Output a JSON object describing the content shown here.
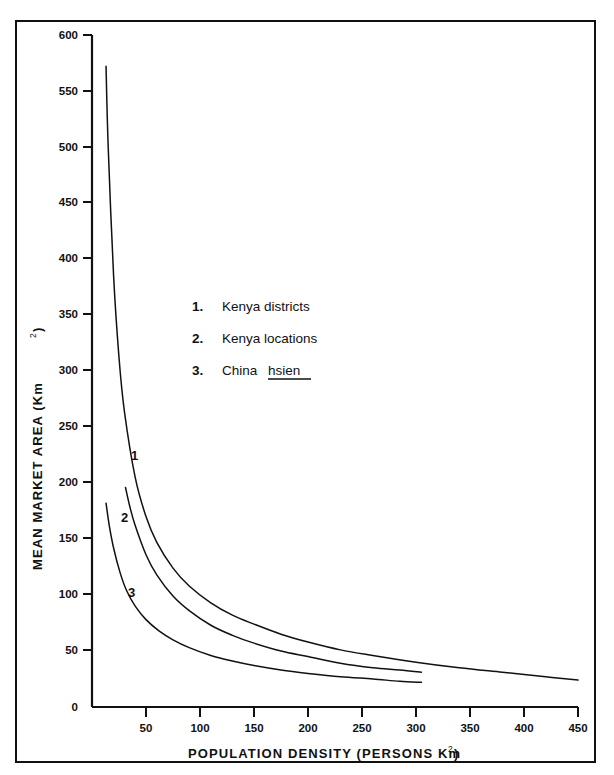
{
  "chart_data": {
    "type": "line",
    "title": "",
    "xlabel": "POPULATION DENSITY  (PERSONS  Km2)",
    "xlabel_main": "POPULATION DENSITY  (PERSONS  Km",
    "xlabel_sup": "2",
    "xlabel_tail": ")",
    "ylabel_main": "MEAN MARKET AREA  (Km",
    "ylabel_sup": "2",
    "ylabel_tail": ")",
    "xlim": [
      0,
      450
    ],
    "ylim": [
      0,
      600
    ],
    "xticks": [
      50,
      100,
      150,
      200,
      250,
      300,
      350,
      400,
      450
    ],
    "yticks": [
      0,
      50,
      100,
      150,
      200,
      250,
      300,
      350,
      400,
      450,
      500,
      550,
      600
    ],
    "xtick_labels": [
      "50",
      "100",
      "150",
      "200",
      "250",
      "300",
      "350",
      "400",
      "450"
    ],
    "ytick_labels": [
      "0",
      "50",
      "100",
      "150",
      "200",
      "250",
      "300",
      "350",
      "400",
      "450",
      "500",
      "550",
      "600"
    ],
    "grid": false,
    "legend_position": "center",
    "series": [
      {
        "id": "1",
        "name": "Kenya districts",
        "curve_label": "1",
        "x": [
          13,
          15,
          20,
          25,
          30,
          40,
          50,
          60,
          75,
          90,
          110,
          130,
          150,
          175,
          200,
          230,
          260,
          300,
          340,
          380,
          420,
          450
        ],
        "y": [
          572,
          500,
          385,
          312,
          264,
          205,
          170,
          147,
          124,
          108,
          93,
          82,
          74,
          65,
          58,
          51,
          46,
          40,
          35,
          31,
          27,
          24
        ]
      },
      {
        "id": "2",
        "name": "Kenya locations",
        "curve_label": "2",
        "x": [
          31,
          35,
          40,
          50,
          60,
          75,
          90,
          110,
          130,
          150,
          175,
          200,
          230,
          260,
          285,
          305
        ],
        "y": [
          196,
          179,
          162,
          136,
          118,
          99,
          86,
          73,
          64,
          57,
          50,
          45,
          39,
          35,
          33,
          31
        ]
      },
      {
        "id": "3",
        "name": "China hsien",
        "curve_label": "3",
        "x": [
          13,
          16,
          20,
          26,
          32,
          40,
          50,
          62,
          75,
          90,
          110,
          130,
          150,
          175,
          200,
          230,
          260,
          285,
          305
        ],
        "y": [
          182,
          162,
          142,
          120,
          104,
          90,
          78,
          68,
          60,
          53,
          46,
          41,
          37,
          33,
          30,
          27,
          25,
          23,
          22
        ]
      }
    ],
    "legend": [
      {
        "number": "1.",
        "label": "Kenya  districts",
        "underline": false
      },
      {
        "number": "2.",
        "label": "Kenya  locations",
        "underline": false
      },
      {
        "number": "3.",
        "label_plain": "China ",
        "label_underlined": "hsien",
        "underline": true
      }
    ]
  }
}
